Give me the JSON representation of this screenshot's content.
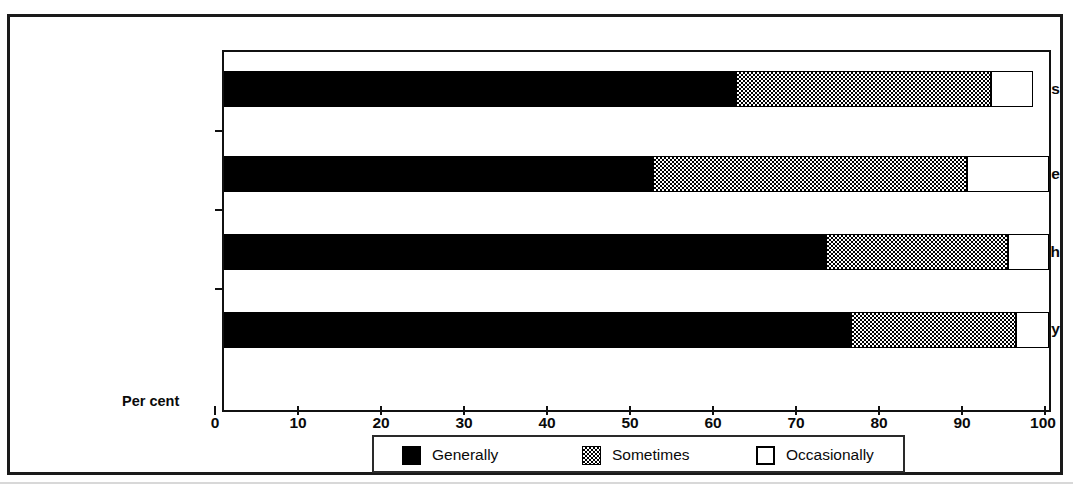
{
  "chart_data": {
    "type": "bar",
    "orientation": "horizontal",
    "stacked": true,
    "title": "",
    "xlabel": "Per cent",
    "ylabel": "",
    "xlim": [
      0,
      100
    ],
    "xticks": [
      0,
      10,
      20,
      30,
      40,
      50,
      60,
      70,
      80,
      90,
      100
    ],
    "grid": false,
    "legend_position": "bottom",
    "categories": [
      "Sec. Maths",
      "Sec. Science",
      "Sec. English",
      "Primary"
    ],
    "series": [
      {
        "name": "Generally",
        "color": "#000000",
        "pattern": "solid-black",
        "values": [
          62,
          52,
          73,
          76
        ]
      },
      {
        "name": "Sometimes",
        "color": "#808080",
        "pattern": "checkerboard",
        "values": [
          31,
          38,
          22,
          20
        ]
      },
      {
        "name": "Occasionally",
        "color": "#ffffff",
        "pattern": "white-outline",
        "values": [
          5,
          10,
          5,
          4
        ]
      }
    ],
    "cumulative_ends": {
      "Sec. Maths": {
        "generally": 62,
        "sometimes": 93,
        "occasionally": 98
      },
      "Sec. Science": {
        "generally": 52,
        "sometimes": 90,
        "occasionally": 100
      },
      "Sec. English": {
        "generally": 73,
        "sometimes": 95,
        "occasionally": 100
      },
      "Primary": {
        "generally": 76,
        "sometimes": 96,
        "occasionally": 100
      }
    }
  },
  "axis": {
    "x_label": "Per cent",
    "x_tick_labels": [
      "0",
      "10",
      "20",
      "30",
      "40",
      "50",
      "60",
      "70",
      "80",
      "90",
      "100"
    ],
    "y_tick_labels": [
      "Sec. Maths",
      "Sec. Science",
      "Sec. English",
      "Primary"
    ]
  },
  "legend": {
    "entries": [
      {
        "label": "Generally",
        "swatch": "solid-black-swatch"
      },
      {
        "label": "Sometimes",
        "swatch": "checkerboard-swatch"
      },
      {
        "label": "Occasionally",
        "swatch": "white-outline-swatch"
      }
    ]
  },
  "colors": {
    "ink": "#000000",
    "frame": "#1a1a1a",
    "paper": "#ffffff",
    "hatch_gray": "#808080"
  }
}
